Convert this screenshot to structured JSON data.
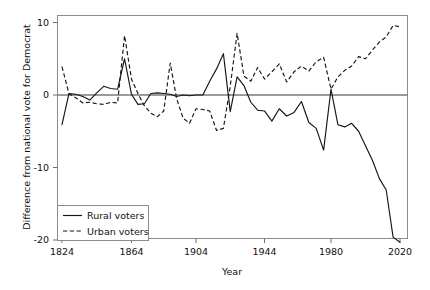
{
  "chart_data": {
    "type": "line",
    "title": "",
    "xlabel": "Year",
    "ylabel": "Difference from national vote for Democrat",
    "xlim": [
      1824,
      2020
    ],
    "ylim": [
      -21,
      11
    ],
    "grid": false,
    "legend_position": "bottom-left",
    "xticks": [
      1824,
      1864,
      1904,
      1944,
      1980,
      2020
    ],
    "xtick_labels": [
      "1824",
      "1864",
      "1904",
      "1944",
      "1980",
      "2020"
    ],
    "yticks": [
      10,
      0,
      -10,
      -20
    ],
    "ytick_labels": [
      "10",
      "0",
      "-10",
      "-20"
    ],
    "reference_line": 0,
    "x": [
      1824,
      1828,
      1832,
      1836,
      1840,
      1844,
      1848,
      1852,
      1856,
      1860,
      1864,
      1868,
      1872,
      1876,
      1880,
      1884,
      1888,
      1892,
      1896,
      1900,
      1904,
      1908,
      1912,
      1916,
      1920,
      1924,
      1928,
      1932,
      1936,
      1940,
      1944,
      1948,
      1952,
      1956,
      1960,
      1964,
      1968,
      1972,
      1976,
      1980,
      1984,
      1988,
      1992,
      1996,
      2000,
      2004,
      2008,
      2012,
      2016,
      2020
    ],
    "series": [
      {
        "name": "Rural voters",
        "style": "solid",
        "values": [
          -4.1,
          0.2,
          0.1,
          -0.2,
          -0.7,
          0.3,
          1.2,
          0.9,
          0.8,
          5.0,
          0.1,
          -1.3,
          -1.2,
          0.2,
          0.3,
          0.2,
          0.1,
          -0.2,
          0.0,
          -0.1,
          0.0,
          0.0,
          1.9,
          3.6,
          5.7,
          -2.3,
          2.5,
          1.3,
          -1.0,
          -2.1,
          -2.2,
          -3.6,
          -1.9,
          -2.9,
          -2.4,
          -0.9,
          -3.8,
          -4.6,
          -7.6,
          0.8,
          -4.1,
          -4.4,
          -3.9,
          -5.0,
          -7.0,
          -9.0,
          -11.5,
          -13.1,
          -19.6,
          -20.3
        ]
      },
      {
        "name": "Urban voters",
        "style": "dashed",
        "values": [
          3.9,
          0.2,
          -0.4,
          -1.1,
          -1.0,
          -1.2,
          -1.3,
          -1.0,
          -1.1,
          8.2,
          2.2,
          0.2,
          -1.5,
          -2.5,
          -3.0,
          -2.2,
          4.4,
          -0.5,
          -3.2,
          -3.9,
          -1.9,
          -2.0,
          -2.2,
          -4.9,
          -4.6,
          1.2,
          8.5,
          2.6,
          1.9,
          3.8,
          2.2,
          3.2,
          4.3,
          1.8,
          3.2,
          4.0,
          3.3,
          4.6,
          5.2,
          0.8,
          2.5,
          3.4,
          4.0,
          5.3,
          5.0,
          6.2,
          7.3,
          8.0,
          9.6,
          9.4
        ]
      }
    ]
  },
  "axis": {
    "x_title": "Year",
    "y_title": "Difference from national vote for Democrat"
  },
  "legend": {
    "entries": [
      {
        "label": "Rural voters"
      },
      {
        "label": "Urban voters"
      }
    ]
  }
}
